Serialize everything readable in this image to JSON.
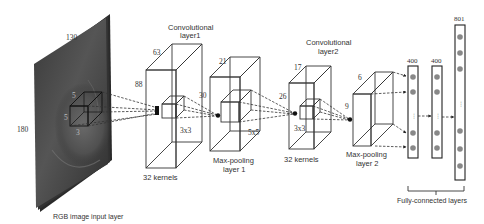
{
  "diagram": {
    "type": "cnn-architecture",
    "input_layer": {
      "label": "RGB image input layer",
      "width": "130",
      "height": "180",
      "kernel_dims": {
        "a": "5",
        "b": "5",
        "c": "3"
      }
    },
    "conv1": {
      "title_line1": "Convolutional",
      "title_line2": "layer1",
      "depth": "63",
      "height": "88",
      "kernel": "3x3",
      "kernels_label": "32 kernels"
    },
    "pool1": {
      "title_line1": "Max-pooling",
      "title_line2": "layer 1",
      "depth": "21",
      "height": "30",
      "kernel": "5x5"
    },
    "conv2": {
      "title_line1": "Convolutional",
      "title_line2": "layer2",
      "depth": "17",
      "height": "26",
      "kernel": "3x3",
      "kernels_label": "32 kernels"
    },
    "pool2": {
      "title_line1": "Max-pooling",
      "title_line2": "layer 2",
      "depth": "6",
      "height": "9"
    },
    "fc_layers": {
      "label": "Fully-connected layers",
      "fc1_size": "400",
      "fc2_size": "400",
      "output_size": "801",
      "ellipsis": "⋮"
    }
  }
}
